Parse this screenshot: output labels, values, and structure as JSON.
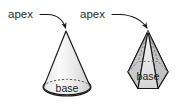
{
  "figure": {
    "background_color": "#ffffff",
    "width": 183,
    "height": 104,
    "annotations": [
      {
        "id": "apex-left",
        "text": "apex",
        "x": 8,
        "y": 18,
        "points_to": "cone-apex"
      },
      {
        "id": "apex-right",
        "text": "apex",
        "x": 80,
        "y": 18,
        "points_to": "pyramid-apex"
      }
    ],
    "shapes": [
      {
        "id": "cone",
        "name": "cone",
        "apex": {
          "x": 66,
          "y": 31
        },
        "base_label": "base",
        "base_label_x": 67,
        "base_label_y": 91,
        "base_ellipse": {
          "cx": 67,
          "cy": 87,
          "rx": 24,
          "ry": 9
        },
        "body_fill_light": "#f2f2f2",
        "body_fill_dark": "#d8d8d8",
        "base_fill": "#a9a9a9",
        "stroke": "#1a1a1a"
      },
      {
        "id": "pyramid",
        "name": "hexagonal pyramid",
        "apex": {
          "x": 148,
          "y": 31
        },
        "base_label": "base",
        "base_label_x": 148,
        "base_label_y": 86,
        "body_fill_light": "#ededed",
        "body_fill_mid": "#cfcfcf",
        "body_fill_dark": "#b4b4b4",
        "base_fill": "#a9a9a9",
        "stroke": "#1a1a1a"
      }
    ],
    "colors": {
      "background": "#ffffff",
      "outline": "#1a1a1a",
      "text": "#2b2b2b",
      "base_gray": "#a9a9a9",
      "body_light": "#f2f2f2",
      "hidden_edge": "#8a8a8a"
    }
  }
}
